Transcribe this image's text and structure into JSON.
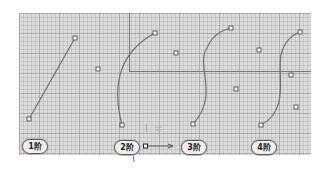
{
  "diagram": {
    "colors": {
      "background": "#dcdcdc",
      "grid_major": "#969696",
      "grid_minor": "#afafaf",
      "curve": "#6e6e6e",
      "axis_line": "#808080",
      "control_point": "#444444"
    },
    "labels": [
      {
        "id": "order-1",
        "text": "1阶",
        "x": 22,
        "y": 139
      },
      {
        "id": "order-2",
        "text": "2阶",
        "x": 114,
        "y": 140
      },
      {
        "id": "order-3",
        "text": "3阶",
        "x": 181,
        "y": 140
      },
      {
        "id": "order-4",
        "text": "4阶",
        "x": 251,
        "y": 140
      }
    ],
    "curves": [
      {
        "order": 1,
        "start": [
          29,
          119
        ],
        "end": [
          75,
          38
        ],
        "controls": [],
        "extra_points": [
          [
            98,
            69
          ]
        ]
      },
      {
        "order": 2,
        "start": [
          122,
          125
        ],
        "end": [
          155,
          33
        ],
        "controls": [
          [
            176,
            53
          ]
        ]
      },
      {
        "order": 3,
        "start": [
          193,
          124
        ],
        "end": [
          231,
          28
        ],
        "controls": [
          [
            259,
            50
          ],
          [
            236,
            89
          ]
        ]
      },
      {
        "order": 4,
        "start": [
          261,
          125
        ],
        "end": [
          300,
          32
        ],
        "controls": [
          [
            291,
            75
          ],
          [
            296,
            107
          ]
        ]
      }
    ],
    "axis_glyph": {
      "origin": [
        146,
        146
      ],
      "arrow_to": [
        173,
        146
      ]
    }
  }
}
